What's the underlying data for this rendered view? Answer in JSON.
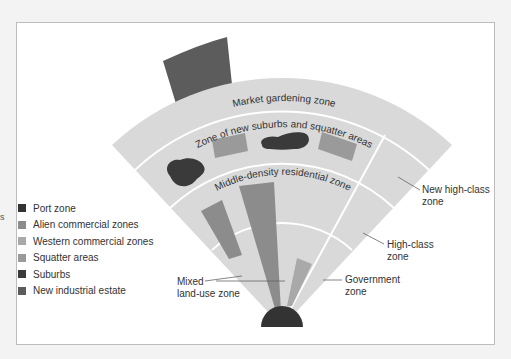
{
  "diagram": {
    "title": "",
    "side_fragment": "s",
    "colors": {
      "fan_fill": "#d9d9d9",
      "divider": "#ffffff",
      "port_zone": "#333333",
      "alien_commercial": "#8c8c8c",
      "western_commercial": "#a9a9a9",
      "squatter": "#9a9a9a",
      "suburbs": "#3a3a3a",
      "new_industrial": "#5c5c5c",
      "leader_line": "#666666"
    },
    "legend": [
      {
        "label": "Port zone",
        "color": "#333333"
      },
      {
        "label": "Alien commercial zones",
        "color": "#8c8c8c"
      },
      {
        "label": "Western commercial zones",
        "color": "#a9a9a9"
      },
      {
        "label": "Squatter areas",
        "color": "#9a9a9a"
      },
      {
        "label": "Suburbs",
        "color": "#3a3a3a"
      },
      {
        "label": "New industrial estate",
        "color": "#5c5c5c"
      }
    ],
    "arc_labels": {
      "market_gardening": "Market gardening zone",
      "new_suburbs": "Zone of new suburbs and squatter areas",
      "middle_density": "Middle-density residential zone"
    },
    "callouts": {
      "new_high_class": [
        "New high-class",
        "zone"
      ],
      "high_class": [
        "High-class",
        "zone"
      ],
      "government": [
        "Government",
        "zone"
      ],
      "mixed_land_use": [
        "Mixed",
        "land-use zone"
      ]
    }
  }
}
